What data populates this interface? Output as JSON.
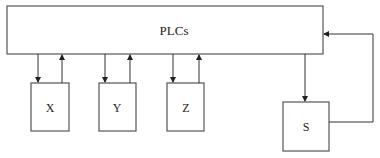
{
  "diagram": {
    "main_block": {
      "label": "PLCs"
    },
    "devices": [
      {
        "label": "X"
      },
      {
        "label": "Y"
      },
      {
        "label": "Z"
      }
    ],
    "feedback_device": {
      "label": "S"
    },
    "colors": {
      "stroke": "#555555",
      "arrow": "#222222",
      "background": "#ffffff"
    }
  }
}
